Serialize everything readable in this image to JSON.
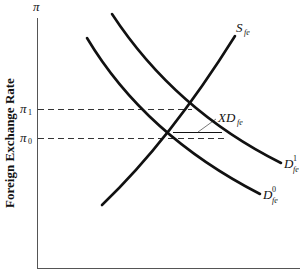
{
  "diagram": {
    "y_axis": {
      "symbol": "π",
      "title": "Foreign Exchange Rate"
    },
    "ticks": [
      {
        "id": "pi1",
        "base": "π",
        "sub": "1",
        "y": 109
      },
      {
        "id": "pi0",
        "base": "π",
        "sub": "0",
        "y": 138
      }
    ],
    "curves": {
      "supply": {
        "base": "S",
        "sub": "fe",
        "sup": ""
      },
      "demand1": {
        "base": "D",
        "sub": "fe",
        "sup": "1"
      },
      "demand0": {
        "base": "D",
        "sub": "fe",
        "sup": "0"
      }
    },
    "excess_demand": {
      "base": "XD",
      "sub": "fe"
    },
    "colors": {
      "line": "#111111",
      "background": "#ffffff"
    }
  }
}
